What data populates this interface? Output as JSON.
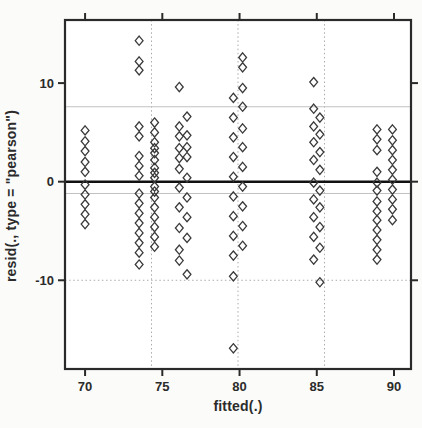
{
  "figure": {
    "background": "#fbfbf9",
    "plot_background": "#ffffff",
    "box_color": "#2a2a2a",
    "grid_color_solid": "#c2c2c2",
    "grid_color_dotted": "#ababab",
    "zero_line_color": "#111111"
  },
  "chart_data": {
    "type": "scatter",
    "title": "",
    "xlabel": "fitted(.)",
    "ylabel": "resid(., type = \"pearson\")",
    "xlim": [
      68.7,
      91.1
    ],
    "ylim": [
      -19.0,
      16.4
    ],
    "x_ticks": [
      70,
      75,
      80,
      85,
      90
    ],
    "y_ticks": [
      -10,
      0,
      10
    ],
    "grid": {
      "x": [
        {
          "value": 74.3,
          "style": "dotted"
        },
        {
          "value": 79.9,
          "style": "dotted"
        },
        {
          "value": 85.5,
          "style": "dotted"
        }
      ],
      "y": [
        {
          "value": 7.6,
          "style": "solid"
        },
        {
          "value": -1.2,
          "style": "solid"
        },
        {
          "value": -10.0,
          "style": "dotted"
        }
      ]
    },
    "reference_line_y": 0,
    "marker": "open-diamond",
    "marker_color": "#3a3a3a",
    "legend": null,
    "series": [
      {
        "name": "pearson-residuals",
        "columns": [
          {
            "fitted": 70.0,
            "residuals": [
              5.2,
              4.1,
              3.1,
              2.0,
              1.0,
              -0.3,
              -1.3,
              -2.3,
              -3.3,
              -4.3
            ]
          },
          {
            "fitted": 73.5,
            "residuals": [
              14.3,
              12.2,
              11.3,
              5.6,
              4.6,
              2.6,
              1.6,
              0.6,
              -1.2,
              -2.2,
              -3.2,
              -4.2,
              -5.2,
              -6.2,
              -7.2,
              -8.4
            ]
          },
          {
            "fitted": 74.5,
            "residuals": [
              6.0,
              5.0,
              4.0,
              3.4,
              2.9,
              2.2,
              1.4,
              0.9,
              0.4,
              -0.5,
              -1.0,
              -1.6,
              -2.6,
              -3.6,
              -4.6,
              -5.6,
              -6.6
            ]
          },
          {
            "fitted": 76.1,
            "residuals": [
              9.6,
              5.6,
              4.6,
              3.4,
              2.4,
              1.3,
              -0.6,
              -2.6,
              -4.7,
              -6.9,
              -8.0
            ]
          },
          {
            "fitted": 76.6,
            "residuals": [
              6.6,
              4.7,
              3.5,
              2.5,
              0.4,
              -1.6,
              -3.6,
              -5.7,
              -9.4
            ]
          },
          {
            "fitted": 79.6,
            "residuals": [
              8.5,
              6.5,
              4.5,
              2.5,
              0.5,
              -1.5,
              -3.5,
              -5.5,
              -7.5,
              -9.6,
              -16.9
            ]
          },
          {
            "fitted": 80.2,
            "residuals": [
              12.6,
              11.6,
              9.5,
              7.6,
              5.4,
              3.5,
              1.5,
              -0.5,
              -2.5,
              -4.5,
              -6.5
            ]
          },
          {
            "fitted": 84.8,
            "residuals": [
              10.1,
              7.4,
              5.6,
              4.0,
              2.2,
              -0.1,
              -1.8,
              -3.6,
              -5.6,
              -7.9
            ]
          },
          {
            "fitted": 85.2,
            "residuals": [
              6.5,
              4.8,
              3.0,
              1.2,
              -0.9,
              -2.6,
              -4.6,
              -6.7,
              -10.2
            ]
          },
          {
            "fitted": 88.9,
            "residuals": [
              5.3,
              4.3,
              3.2,
              1.0,
              -0.1,
              -0.9,
              -2.0,
              -3.0,
              -3.9,
              -4.9,
              -5.9,
              -6.9,
              -7.9
            ]
          },
          {
            "fitted": 89.9,
            "residuals": [
              5.3,
              4.2,
              3.2,
              2.2,
              1.2,
              0.2,
              -0.8,
              -1.8,
              -2.8,
              -3.9
            ]
          }
        ]
      }
    ]
  }
}
